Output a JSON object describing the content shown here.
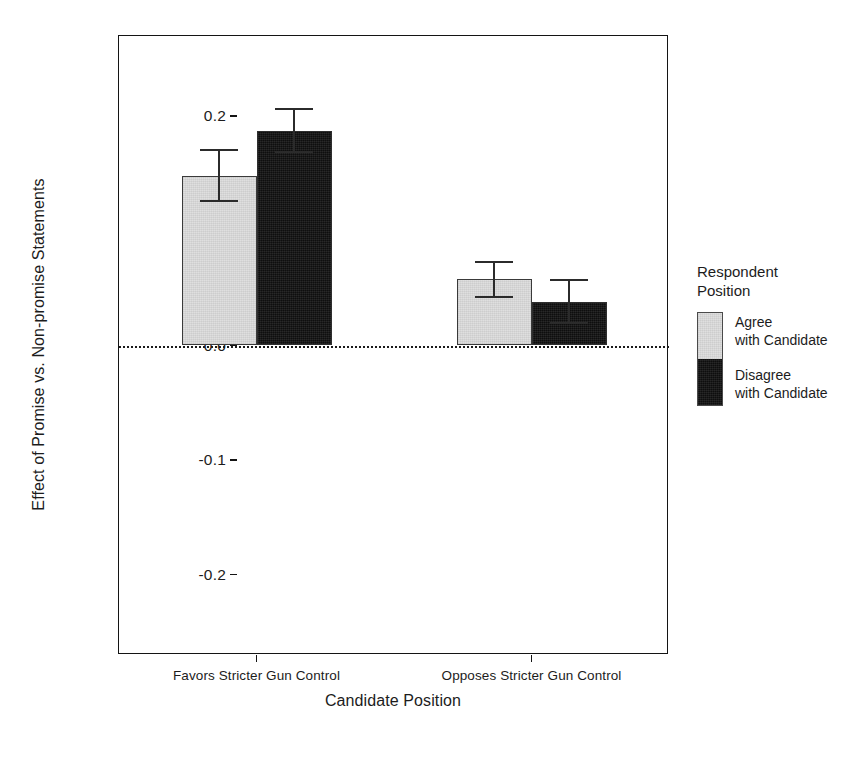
{
  "chart_data": {
    "type": "bar",
    "title": "",
    "subtitle": "",
    "xlabel": "Candidate Position",
    "ylabel": "Effect of Promise vs. Non-promise Statements",
    "categories": [
      "Favors Stricter Gun Control",
      "Opposes Stricter Gun Control"
    ],
    "ylim": [
      -0.27,
      0.27
    ],
    "yticks": [
      0.2,
      0.1,
      0.0,
      -0.1,
      -0.2
    ],
    "ytick_labels": [
      "0.2",
      "0.1",
      "0.0",
      "-0.1",
      "-0.2"
    ],
    "grid": false,
    "legend_position": "right",
    "zero_reference_line": 0.0,
    "series": [
      {
        "name": "Agree with Candidate",
        "color": "#dcdcdc",
        "values": [
          0.148,
          0.058
        ],
        "errors_low": [
          0.125,
          0.041
        ],
        "errors_high": [
          0.171,
          0.074
        ]
      },
      {
        "name": "Disagree with Candidate",
        "color": "#121212",
        "values": [
          0.187,
          0.038
        ],
        "errors_low": [
          0.168,
          0.019
        ],
        "errors_high": [
          0.207,
          0.058
        ]
      }
    ]
  },
  "axes": {
    "y_title": "Effect of Promise vs. Non-promise Statements",
    "x_title": "Candidate Position",
    "y_tick_labels": [
      "0.2",
      "0.1",
      "0.0",
      "-0.1",
      "-0.2"
    ],
    "x_tick_labels": [
      "Favors Stricter Gun Control",
      "Opposes Stricter Gun Control"
    ]
  },
  "legend": {
    "title": "Respondent\nPosition",
    "entries": [
      {
        "label": "Agree\nwith Candidate",
        "color": "#dcdcdc"
      },
      {
        "label": "Disagree\nwith Candidate",
        "color": "#121212"
      }
    ]
  }
}
